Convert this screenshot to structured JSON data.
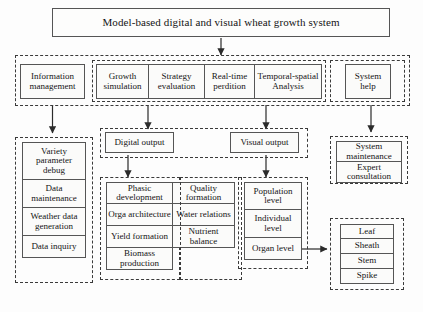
{
  "diagram": {
    "title_box": {
      "label": "Model-based digital and visual wheat growth system"
    },
    "menu_row": {
      "information_management": "Information management",
      "growth_simulation": "Growth simulation",
      "strategy_evaluation": "Strategy evaluation",
      "real_time_perdition": "Real-time perdition",
      "temporal_spatial_analysis": "Temporal-spatial Analysis",
      "system_help": "System help"
    },
    "left_column": {
      "items": [
        "Variety parameter debug",
        "Data maintenance",
        "Weather data generation",
        "Data inquiry"
      ]
    },
    "output_row": {
      "digital_output": "Digital output",
      "visual_output": "Visual output"
    },
    "digital_detail": {
      "left": [
        "Phasic development",
        "Orga architecture",
        "Yield formation",
        "Biomass production"
      ],
      "right": [
        "Quality formation",
        "Water relations",
        "Nutrient balance"
      ]
    },
    "visual_detail": {
      "items": [
        "Population level",
        "Individual level",
        "Organ level"
      ]
    },
    "support_group": {
      "items": [
        "System maintenance",
        "Expert consultation"
      ]
    },
    "organ_group": {
      "items": [
        "Leaf",
        "Sheath",
        "Stem",
        "Spike"
      ]
    }
  },
  "colors": {
    "box_border": "#555555",
    "group_border": "#3a3a3a",
    "arrow": "#2b2b2b",
    "background": "#fdfdfd"
  }
}
